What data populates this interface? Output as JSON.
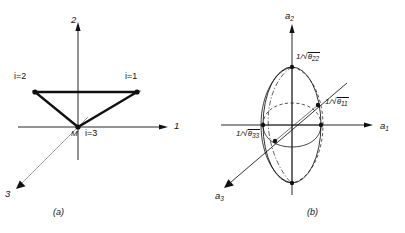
{
  "figure": {
    "type": "technical-diagram",
    "panels": [
      {
        "id": "a",
        "caption": "(a)",
        "description": "triangular element with three nodes in a 1-2-3 coordinate system",
        "axes": [
          {
            "name": "axis-1",
            "label": "1",
            "direction": "right"
          },
          {
            "name": "axis-2",
            "label": "2",
            "direction": "up"
          },
          {
            "name": "axis-3",
            "label": "3",
            "direction": "lower-left"
          }
        ],
        "nodes": [
          {
            "name": "node-i1",
            "label": "i=1",
            "x": 137,
            "y": 92
          },
          {
            "name": "node-i2",
            "label": "i=2",
            "x": 35,
            "y": 92
          },
          {
            "name": "node-i3",
            "label": "i=3",
            "x": 78,
            "y": 127
          }
        ],
        "origin_label": "M"
      },
      {
        "id": "b",
        "caption": "(b)",
        "description": "ellipsoid of yield surface with principal semi-axes in an a1-a2-a3 coordinate system",
        "axes": [
          {
            "name": "axis-a1",
            "label": "a",
            "sub": "1",
            "direction": "right"
          },
          {
            "name": "axis-a2",
            "label": "a",
            "sub": "2",
            "direction": "up"
          },
          {
            "name": "axis-a3",
            "label": "a",
            "sub": "3",
            "direction": "lower-left"
          }
        ],
        "semi_axes": [
          {
            "name": "semi-axis-a1",
            "prefix": "1/",
            "radical": "√",
            "base": "θ",
            "sub": "11",
            "text": "1/√θ₁₁"
          },
          {
            "name": "semi-axis-a2",
            "prefix": "1/",
            "radical": "√",
            "base": "θ",
            "sub": "22",
            "text": "1/√θ₂₂"
          },
          {
            "name": "semi-axis-a3",
            "prefix": "1/",
            "radical": "√",
            "base": "θ",
            "sub": "33",
            "text": "1/√θ₃₃"
          }
        ]
      }
    ]
  },
  "colors": {
    "stroke": "#111111",
    "thin": "#6a6a6a",
    "background": "#ffffff"
  }
}
